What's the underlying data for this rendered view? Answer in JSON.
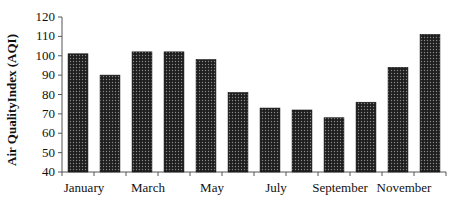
{
  "chart_data": {
    "type": "bar",
    "title": "",
    "xlabel": "",
    "ylabel": "Air QualityIndex (AQI)",
    "ylim": [
      40,
      120
    ],
    "yticks": [
      40,
      50,
      60,
      70,
      80,
      90,
      100,
      110,
      120
    ],
    "grid": false,
    "legend": null,
    "categories": [
      "January",
      "February",
      "March",
      "April",
      "May",
      "June",
      "July",
      "August",
      "September",
      "October",
      "November",
      "December"
    ],
    "visible_x_tick_labels": [
      "January",
      "March",
      "May",
      "July",
      "September",
      "November"
    ],
    "values": [
      101,
      90,
      102,
      102,
      98,
      81,
      73,
      72,
      68,
      76,
      94,
      111
    ],
    "bar_fill": "#2a2a2a",
    "bar_pattern": "dotted"
  }
}
